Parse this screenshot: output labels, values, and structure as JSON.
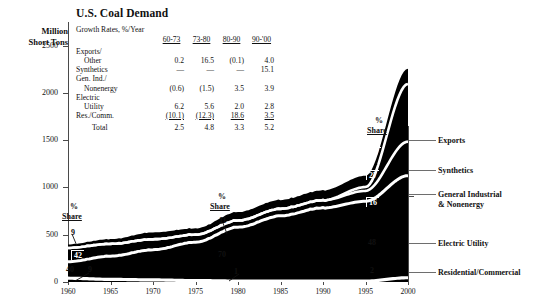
{
  "chart_data": {
    "type": "area",
    "title": "U.S. Coal Demand",
    "ylabel": "Million Short Tons",
    "xlabel": "",
    "ylim": [
      0,
      2750
    ],
    "xlim": [
      1960,
      2000
    ],
    "grid": false,
    "legend_position": "right",
    "y_ticks": [
      "0",
      "500",
      "1000",
      "1500",
      "2000",
      "2500"
    ],
    "y_tick_values": [
      0,
      500,
      1000,
      1500,
      2000,
      2500
    ],
    "x_ticks": [
      "1960",
      "1965",
      "1970",
      "1975",
      "1980",
      "1985",
      "1990",
      "1995",
      "2000"
    ],
    "x_tick_values": [
      1960,
      1965,
      1970,
      1975,
      1980,
      1985,
      1990,
      1995,
      2000
    ],
    "stacking_order_bottom_to_top": [
      "Residential/Commercial",
      "Electric Utility",
      "General Industrial & Nonenergy",
      "Synthetics",
      "Exports"
    ],
    "x": [
      1960,
      1965,
      1970,
      1975,
      1980,
      1985,
      1990,
      1995,
      2000
    ],
    "series": [
      {
        "name": "Residential/Commercial",
        "values": [
          40,
          28,
          22,
          15,
          10,
          9,
          9,
          9,
          45
        ]
      },
      {
        "name": "Electric Utility",
        "values": [
          175,
          245,
          320,
          405,
          570,
          690,
          775,
          845,
          1080
        ]
      },
      {
        "name": "General Industrial & Nonenergy",
        "values": [
          145,
          130,
          110,
          80,
          70,
          75,
          80,
          110,
          360
        ]
      },
      {
        "name": "Synthetics",
        "values": [
          0,
          0,
          0,
          0,
          0,
          0,
          0,
          40,
          610
        ]
      },
      {
        "name": "Exports",
        "values": [
          37,
          50,
          72,
          65,
          90,
          93,
          105,
          120,
          160
        ]
      },
      {
        "name": "Total",
        "values": [
          397,
          453,
          524,
          565,
          740,
          867,
          969,
          1124,
          2255
        ]
      }
    ],
    "annotations": {
      "left_share": {
        "header_pct": "%",
        "header_label": "Share",
        "year": "1960",
        "values": [
          {
            "label": "9",
            "series": "Exports"
          },
          {
            "label": "42",
            "series": "Electric Utility"
          },
          {
            "label": "40",
            "series": "General Industrial & Nonenergy"
          },
          {
            "label": "9",
            "series": "Residential/Commercial"
          }
        ]
      },
      "middle_share": {
        "header_pct": "%",
        "header_label": "Share",
        "year": "1985",
        "values": [
          {
            "label": "11",
            "series": "Exports"
          },
          {
            "label": "70",
            "series": "Electric Utility"
          },
          {
            "label": "1",
            "series": "Residential/Commercial"
          }
        ]
      },
      "right_share": {
        "header_pct": "%",
        "header_label": "Share",
        "year": "2000",
        "values": [
          {
            "label": "7",
            "series": "Exports"
          },
          {
            "label": "27",
            "series": "Synthetics"
          },
          {
            "label": "16",
            "series": "General Industrial & Nonenergy"
          },
          {
            "label": "48",
            "series": "Electric Utility"
          },
          {
            "label": "2",
            "series": "Residential/Commercial"
          }
        ]
      }
    },
    "growth_rates_table": {
      "caption": "Growth Rates, %/Year",
      "columns": [
        "60-73",
        "73-80",
        "80-90",
        "90-'00"
      ],
      "rows": [
        {
          "label_line1": "Exports/",
          "label_line2": "Other",
          "values": [
            "0.2",
            "16.5",
            "(0.1)",
            "4.0"
          ]
        },
        {
          "label_line1": "Synthetics",
          "label_line2": "",
          "values": [
            "—",
            "—",
            "—",
            "15.1"
          ]
        },
        {
          "label_line1": "Gen. Ind./",
          "label_line2": "Nonenergy",
          "values": [
            "(0.6)",
            "(1.5)",
            "3.5",
            "3.9"
          ]
        },
        {
          "label_line1": "Electric",
          "label_line2": "Utility",
          "values": [
            "6.2",
            "5.6",
            "2.0",
            "2.8"
          ]
        },
        {
          "label_line1": "Res./Comm.",
          "label_line2": "",
          "values": [
            "(10.1)",
            "(12.3)",
            "18.6",
            "3.5"
          ],
          "underline": true
        },
        {
          "label_line1": "Total",
          "label_line2": "",
          "values": [
            "2.5",
            "4.8",
            "3.3",
            "5.2"
          ],
          "total": true
        }
      ]
    },
    "legend": [
      {
        "label": "Exports"
      },
      {
        "label": "Synthetics"
      },
      {
        "label_line1": "General Industrial",
        "label_line2": "& Nonenergy"
      },
      {
        "label": "Electric Utility"
      },
      {
        "label": "Residential/Commercial"
      }
    ],
    "colors": {
      "fill": "#000000",
      "separator": "#ffffff",
      "axis": "#4a4a4a",
      "text": "#111111",
      "leader": "#6e6e6e"
    }
  }
}
